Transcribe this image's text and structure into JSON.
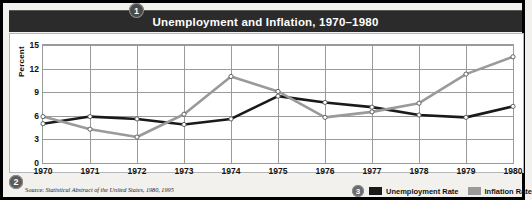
{
  "figure": {
    "title": "Unemployment and Inflation, 1970–1980",
    "badges": {
      "title_badge": "1",
      "source_badge": "2",
      "legend_badge": "3"
    },
    "source_lead": "Source:",
    "source_citation": "Statistical Abstract of the United States, 1980, 1995",
    "border_color": "#000000",
    "title_bar_color": "#2b2b2b",
    "panel_color": "#ffffff",
    "page_color": "#f3f1ee"
  },
  "chart_data": {
    "type": "line",
    "title": "Unemployment and Inflation, 1970–1980",
    "xlabel": "",
    "ylabel": "Percent",
    "x": [
      1970,
      1971,
      1972,
      1973,
      1974,
      1975,
      1976,
      1977,
      1978,
      1979,
      1980
    ],
    "categories": [
      "1970",
      "1971",
      "1972",
      "1973",
      "1974",
      "1975",
      "1976",
      "1977",
      "1978",
      "1979",
      "1980"
    ],
    "xlim": [
      1970,
      1980
    ],
    "ylim": [
      0,
      15
    ],
    "yticks": [
      0,
      3,
      6,
      9,
      12,
      15
    ],
    "grid": true,
    "legend_position": "bottom-right",
    "series": [
      {
        "name": "Unemployment Rate",
        "color": "#1a1a1a",
        "values": [
          5.0,
          5.9,
          5.6,
          4.9,
          5.6,
          8.5,
          7.7,
          7.1,
          6.1,
          5.8,
          7.2
        ]
      },
      {
        "name": "Inflation Rate",
        "color": "#9a9a9a",
        "values": [
          5.9,
          4.3,
          3.3,
          6.2,
          11.0,
          9.1,
          5.8,
          6.5,
          7.6,
          11.3,
          13.5
        ]
      }
    ]
  }
}
